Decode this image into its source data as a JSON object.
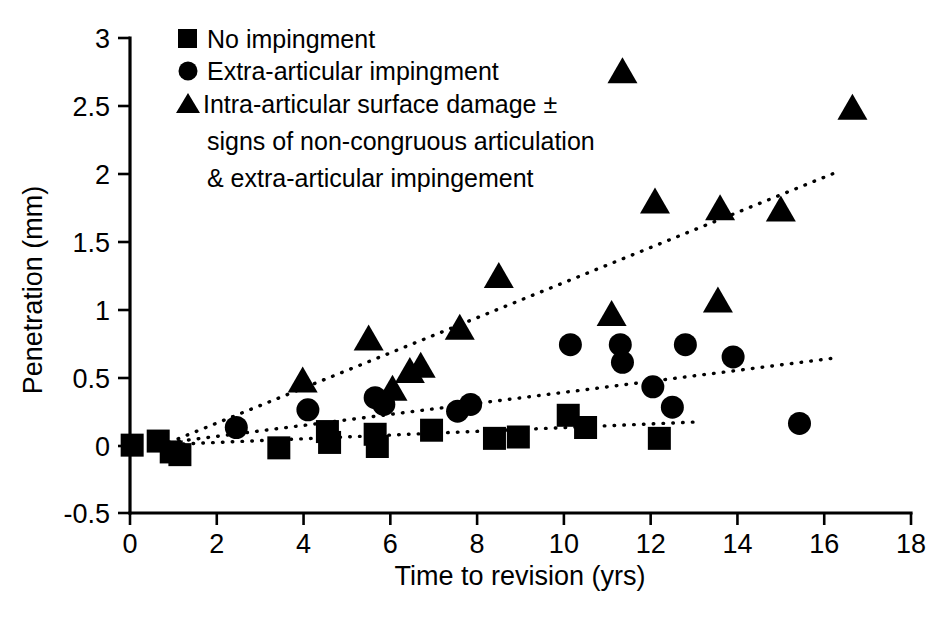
{
  "chart_data": {
    "type": "scatter",
    "title": "",
    "xlabel": "Time to revision (yrs)",
    "ylabel": "Penetration (mm)",
    "xlim": [
      0,
      18
    ],
    "ylim": [
      -0.5,
      3
    ],
    "xticks": [
      0,
      2,
      4,
      6,
      8,
      10,
      12,
      14,
      16,
      18
    ],
    "xtick_labels": [
      "0",
      "2",
      "4",
      "6",
      "8",
      "10",
      "12",
      "14",
      "16",
      "18"
    ],
    "yticks": [
      -0.5,
      0,
      0.5,
      1,
      1.5,
      2,
      2.5,
      3
    ],
    "ytick_labels": [
      "-0.5",
      "0",
      "0.5",
      "1",
      "1.5",
      "2",
      "2.5",
      "3"
    ],
    "grid": false,
    "legend_position": "top-left",
    "series": [
      {
        "name": "No impingment",
        "marker": "square",
        "legend_label": "No impingment",
        "points": [
          [
            0.05,
            0.0
          ],
          [
            0.65,
            0.03
          ],
          [
            0.95,
            -0.05
          ],
          [
            1.15,
            -0.07
          ],
          [
            3.43,
            -0.02
          ],
          [
            4.55,
            0.1
          ],
          [
            4.6,
            0.02
          ],
          [
            5.65,
            0.08
          ],
          [
            5.7,
            -0.01
          ],
          [
            6.95,
            0.11
          ],
          [
            8.4,
            0.05
          ],
          [
            8.95,
            0.06
          ],
          [
            10.1,
            0.22
          ],
          [
            10.5,
            0.13
          ],
          [
            12.2,
            0.05
          ]
        ]
      },
      {
        "name": "Extra-articular impingment",
        "marker": "circle",
        "legend_label": "Extra-articular impingment",
        "points": [
          [
            2.45,
            0.13
          ],
          [
            4.1,
            0.26
          ],
          [
            5.65,
            0.35
          ],
          [
            5.85,
            0.3
          ],
          [
            7.55,
            0.25
          ],
          [
            7.85,
            0.3
          ],
          [
            10.15,
            0.74
          ],
          [
            11.3,
            0.74
          ],
          [
            11.35,
            0.61
          ],
          [
            12.05,
            0.43
          ],
          [
            12.5,
            0.28
          ],
          [
            12.8,
            0.74
          ],
          [
            13.9,
            0.65
          ],
          [
            15.43,
            0.16
          ]
        ]
      },
      {
        "name": "Intra-articular surface damage",
        "marker": "triangle",
        "legend_label": "Intra-articular surface damage ± signs of non-congruous articulation & extra-articular impingement",
        "points": [
          [
            3.98,
            0.46
          ],
          [
            5.5,
            0.77
          ],
          [
            6.05,
            0.4
          ],
          [
            6.45,
            0.53
          ],
          [
            6.7,
            0.57
          ],
          [
            7.6,
            0.85
          ],
          [
            8.5,
            1.23
          ],
          [
            11.1,
            0.95
          ],
          [
            11.35,
            2.74
          ],
          [
            12.1,
            1.78
          ],
          [
            13.55,
            1.05
          ],
          [
            13.6,
            1.73
          ],
          [
            15.0,
            1.72
          ],
          [
            16.65,
            2.47
          ]
        ]
      }
    ],
    "trendlines": [
      {
        "name": "no-impingment-trend",
        "x0": 0.55,
        "y0": 0.0,
        "x1": 13.0,
        "y1": 0.17
      },
      {
        "name": "extra-articular-trend",
        "x0": 0.9,
        "y0": 0.02,
        "x1": 16.2,
        "y1": 0.64
      },
      {
        "name": "intra-articular-trend",
        "x0": 0.9,
        "y0": 0.02,
        "x1": 16.2,
        "y1": 2.0
      }
    ]
  },
  "legend": {
    "entries": [
      {
        "marker": "square",
        "label": "No impingment"
      },
      {
        "marker": "circle",
        "label": "Extra-articular impingment"
      },
      {
        "marker": "triangle",
        "label": "Intra-articular surface damage ±"
      }
    ],
    "continuation_lines": [
      "signs of non-congruous articulation",
      "& extra-articular impingement"
    ]
  },
  "axes": {
    "x_title": "Time to revision (yrs)",
    "y_title": "Penetration (mm)",
    "x_labels": [
      "0",
      "2",
      "4",
      "6",
      "8",
      "10",
      "12",
      "14",
      "16",
      "18"
    ],
    "y_labels": [
      "3",
      "2.5",
      "2",
      "1.5",
      "1",
      "0.5",
      "0",
      "-0.5"
    ]
  },
  "colors": {
    "marker": "#000000",
    "axis": "#000000",
    "background": "#ffffff"
  }
}
